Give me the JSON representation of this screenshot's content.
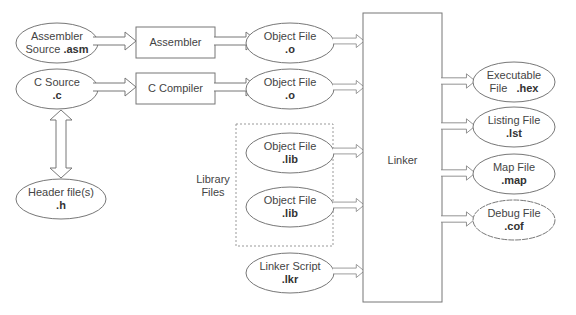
{
  "diagram": {
    "colors": {
      "stroke": "#777777",
      "text": "#444444",
      "background": "#ffffff"
    },
    "sources": [
      {
        "id": "asm",
        "label": "Assembler",
        "label2": "Source",
        "ext": ".asm"
      },
      {
        "id": "c",
        "label": "C Source",
        "ext": ".c"
      },
      {
        "id": "h",
        "label": "Header file(s)",
        "ext": ".h"
      }
    ],
    "tools": [
      {
        "id": "assembler",
        "label": "Assembler"
      },
      {
        "id": "ccompiler",
        "label": "C Compiler"
      }
    ],
    "objects": [
      {
        "id": "obj1",
        "label": "Object File",
        "ext": ".o"
      },
      {
        "id": "obj2",
        "label": "Object File",
        "ext": ".o"
      }
    ],
    "library": {
      "group_label_line1": "Library",
      "group_label_line2": "Files",
      "items": [
        {
          "id": "lib1",
          "label": "Object File",
          "ext": ".lib"
        },
        {
          "id": "lib2",
          "label": "Object File",
          "ext": ".lib"
        }
      ]
    },
    "linker_script": {
      "label": "Linker Script",
      "ext": ".lkr"
    },
    "linker": {
      "label": "Linker"
    },
    "outputs": [
      {
        "id": "hex",
        "label": "Executable",
        "label2": "File",
        "ext": ".hex"
      },
      {
        "id": "lst",
        "label": "Listing File",
        "ext": ".lst"
      },
      {
        "id": "map",
        "label": "Map File",
        "ext": ".map"
      },
      {
        "id": "cof",
        "label": "Debug File",
        "ext": ".cof"
      }
    ]
  }
}
